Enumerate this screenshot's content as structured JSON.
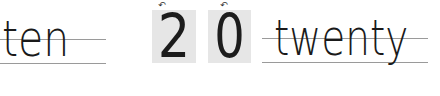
{
  "left_word": {
    "text": "ten"
  },
  "digits": [
    {
      "text": "2",
      "stroke_hint": "↶"
    },
    {
      "text": "0",
      "stroke_hint": "↶"
    }
  ],
  "right_word": {
    "text": "twenty"
  },
  "colors": {
    "guide_line": "#9a9a9a",
    "digit_box": "#e6e6e6",
    "ink": "#1a1a1a"
  }
}
